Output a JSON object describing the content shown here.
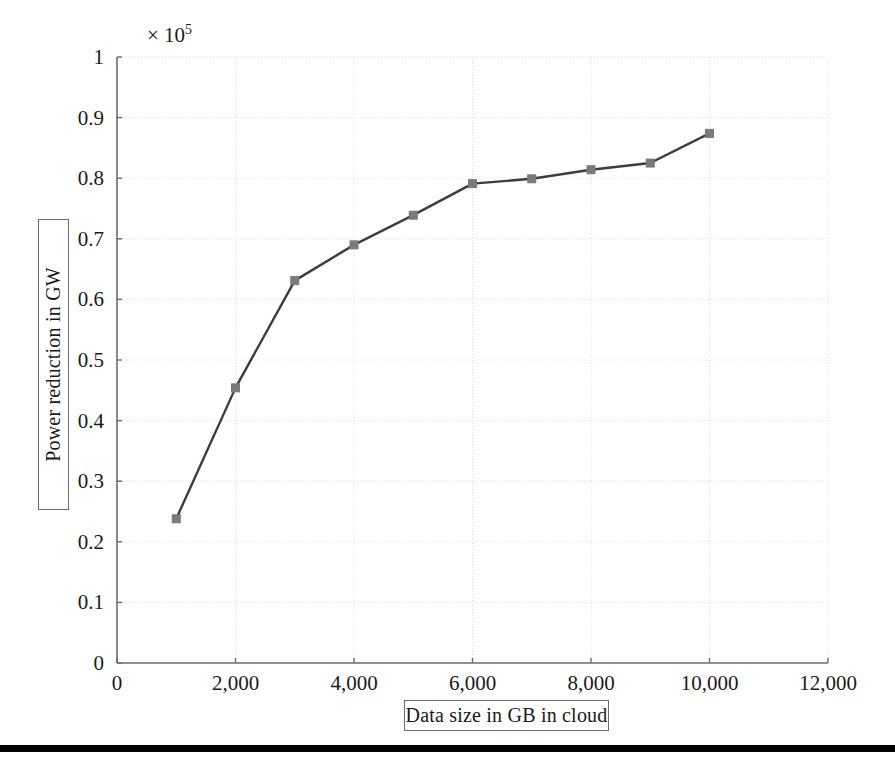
{
  "figure": {
    "background_color": "#ffffff",
    "axis_color": "#6b6b6b",
    "grid_color": "#dcdcdc",
    "line_color": "#3c3c3c",
    "marker_color": "#7a7a7a",
    "text_color": "#1a1a1a",
    "exponent_prefix": "× 10",
    "exponent_power": "5"
  },
  "chart_data": {
    "type": "line",
    "title": "",
    "xlabel": "Data size in GB in cloud",
    "ylabel": "Power reduction in GW",
    "y_exponent_label": "× 10⁵",
    "y_scale_factor": 100000,
    "xlim": [
      0,
      12000
    ],
    "ylim": [
      0,
      1
    ],
    "xticks": [
      0,
      2000,
      4000,
      6000,
      8000,
      10000,
      12000
    ],
    "xtick_labels": [
      "0",
      "2,000",
      "4,000",
      "6,000",
      "8,000",
      "10,000",
      "12,000"
    ],
    "yticks": [
      0,
      0.1,
      0.2,
      0.3,
      0.4,
      0.5,
      0.6,
      0.7,
      0.8,
      0.9,
      1
    ],
    "ytick_labels": [
      "0",
      "0.1",
      "0.2",
      "0.3",
      "0.4",
      "0.5",
      "0.6",
      "0.7",
      "0.8",
      "0.9",
      "1"
    ],
    "grid": true,
    "legend": null,
    "legend_position": "none",
    "marker": "square",
    "x": [
      1000,
      2000,
      3000,
      4000,
      5000,
      6000,
      7000,
      8000,
      9000,
      10000
    ],
    "y": [
      0.238,
      0.454,
      0.631,
      0.69,
      0.739,
      0.791,
      0.799,
      0.814,
      0.825,
      0.874
    ],
    "series": [
      {
        "name": "Power reduction",
        "x": [
          1000,
          2000,
          3000,
          4000,
          5000,
          6000,
          7000,
          8000,
          9000,
          10000
        ],
        "values": [
          0.238,
          0.454,
          0.631,
          0.69,
          0.739,
          0.791,
          0.799,
          0.814,
          0.825,
          0.874
        ],
        "values_scaled": [
          23800,
          45400,
          63100,
          69000,
          73900,
          79100,
          79900,
          81400,
          82500,
          87400
        ]
      }
    ]
  }
}
